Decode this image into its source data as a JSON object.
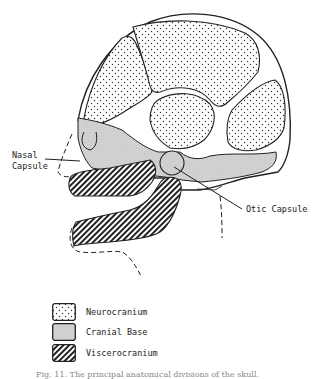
{
  "diagram": {
    "labels": {
      "nasal_capsule": "Nasal\nCapsule",
      "otic_capsule": "Otic Capsule"
    },
    "regions": [
      {
        "name": "Neurocranium",
        "pattern": "stipple",
        "color": "#ffffff"
      },
      {
        "name": "Cranial Base",
        "pattern": "gray-fill",
        "color": "#d4d4d4"
      },
      {
        "name": "Viscerocranium",
        "pattern": "diagonal-hatch",
        "color": "#222222"
      }
    ]
  },
  "legend": {
    "items": [
      {
        "label": "Neurocranium"
      },
      {
        "label": "Cranial Base"
      },
      {
        "label": "Viscerocranium"
      }
    ]
  },
  "caption": {
    "text": "Fig. 11.  The principal anatomical divisions of the skull."
  }
}
